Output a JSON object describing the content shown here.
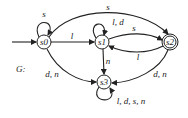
{
  "graph_label": "G:",
  "states": [
    {
      "id": "s0",
      "label": "s0",
      "start": true,
      "accepting": false
    },
    {
      "id": "s1",
      "label": "s1",
      "start": false,
      "accepting": false
    },
    {
      "id": "s2",
      "label": "s2",
      "start": false,
      "accepting": true
    },
    {
      "id": "s3",
      "label": "s3",
      "start": false,
      "accepting": false
    }
  ],
  "transitions": [
    {
      "from": "s0",
      "to": "s0",
      "label": "s"
    },
    {
      "from": "s0",
      "to": "s1",
      "label": "l"
    },
    {
      "from": "s0",
      "to": "s2",
      "label": "s"
    },
    {
      "from": "s0",
      "to": "s3",
      "label": "d, n"
    },
    {
      "from": "s1",
      "to": "s1",
      "label": "l, d"
    },
    {
      "from": "s1",
      "to": "s2",
      "label": "s"
    },
    {
      "from": "s1",
      "to": "s3",
      "label": "n"
    },
    {
      "from": "s2",
      "to": "s1",
      "label": "l"
    },
    {
      "from": "s2",
      "to": "s3",
      "label": "d, n"
    },
    {
      "from": "s3",
      "to": "s3",
      "label": "l, d, s, n"
    }
  ]
}
